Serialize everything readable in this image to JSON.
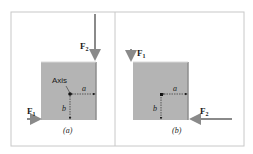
{
  "figure": {
    "panels": [
      {
        "id": "a",
        "caption": "(a)",
        "axis_label": "Axis",
        "force1": {
          "label": "F",
          "sub": "1",
          "direction": "right",
          "position": "bottom-left"
        },
        "force2": {
          "label": "F",
          "sub": "2",
          "direction": "down",
          "position": "top-right"
        },
        "dim_a": "a",
        "dim_b": "b"
      },
      {
        "id": "b",
        "caption": "(b)",
        "force1": {
          "label": "F",
          "sub": "1",
          "direction": "down",
          "position": "top-left"
        },
        "force2": {
          "label": "F",
          "sub": "2",
          "direction": "left",
          "position": "bottom-right"
        },
        "dim_a": "a",
        "dim_b": "b"
      }
    ],
    "colors": {
      "block": "#b4b4b4",
      "block_edge": "#8e8e8e",
      "arrow": "#8a8a8a",
      "frame": "#c8c8c8"
    }
  }
}
